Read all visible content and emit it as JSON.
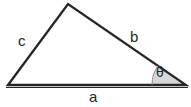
{
  "diagram": {
    "type": "triangle-with-angle",
    "background_color": "#ffffff",
    "stroke_color": "#262626",
    "fill_color": "#ffffff",
    "angle_wedge_color": "#d8d8d8",
    "label_color": "#262626",
    "vertices": {
      "left": [
        8,
        85
      ],
      "apex": [
        68,
        4
      ],
      "right": [
        186,
        85
      ]
    },
    "baseline": {
      "start": [
        6,
        86
      ],
      "end": [
        188,
        86
      ]
    },
    "angle_arc": {
      "center": [
        186,
        85
      ],
      "radius": 34,
      "start_angle_deg": 180,
      "end_angle_deg": 145
    },
    "labels": {
      "side_a": "a",
      "side_b": "b",
      "side_c": "c",
      "angle_theta": "θ"
    }
  }
}
